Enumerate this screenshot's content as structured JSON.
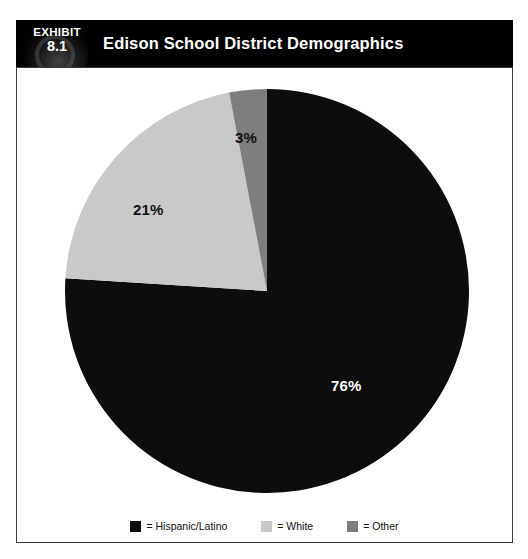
{
  "exhibit": {
    "label": "EXHIBIT",
    "number": "8.1",
    "title": "Edison School District Demographics"
  },
  "colors": {
    "header_background": "#010101",
    "panel_background": "#ffffff",
    "panel_border": "#3a3a3a",
    "hispanic_latino": "#0d0d0d",
    "white": "#c9c9c9",
    "other": "#7e7e7e",
    "label_on_dark": "#ffffff",
    "label_on_light": "#111111"
  },
  "labels": {
    "hispanic_latino": "76%",
    "white": "21%",
    "other": "3%"
  },
  "legend": {
    "items": [
      {
        "name": "hispanic-latino",
        "text": "= Hispanic/Latino",
        "color": "#0d0d0d"
      },
      {
        "name": "white",
        "text": "= White",
        "color": "#c9c9c9"
      },
      {
        "name": "other",
        "text": "= Other",
        "color": "#7e7e7e"
      }
    ]
  },
  "chart_data": {
    "type": "pie",
    "title": "Edison School District Demographics",
    "categories": [
      "Hispanic/Latino",
      "White",
      "Other"
    ],
    "values": [
      76,
      21,
      3
    ],
    "value_labels": [
      "76%",
      "21%",
      "3%"
    ],
    "units": "percent",
    "total": 100,
    "start_angle_deg": 0,
    "direction": "clockwise",
    "slice_colors": [
      "#0d0d0d",
      "#c9c9c9",
      "#7e7e7e"
    ],
    "label_text_colors": [
      "#ffffff",
      "#111111",
      "#111111"
    ],
    "legend": [
      "= Hispanic/Latino",
      "= White",
      "= Other"
    ],
    "legend_position": "bottom",
    "grid": false,
    "xlabel": "",
    "ylabel": ""
  }
}
